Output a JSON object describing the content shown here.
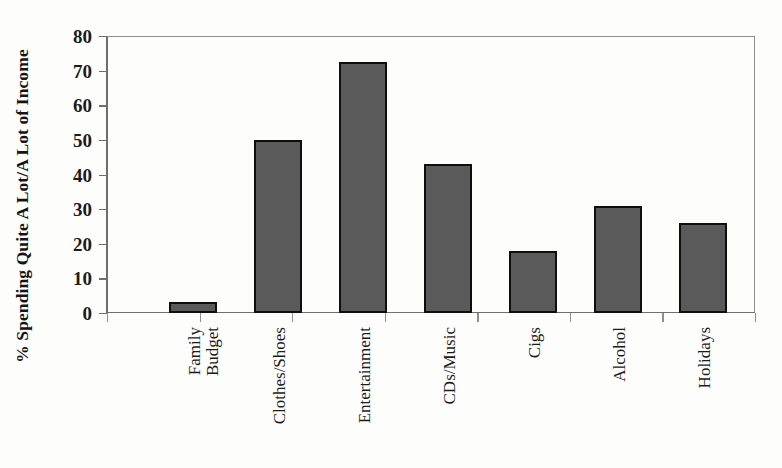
{
  "chart_data": {
    "type": "bar",
    "title": "",
    "subtitle": "",
    "xlabel": "",
    "ylabel": "% Spending Quite A Lot/A Lot of Income",
    "categories": [
      "Family Budget",
      "Clothes/Shoes",
      "Entertainment",
      "CDs/Music",
      "Cigs",
      "Alcohol",
      "Holidays"
    ],
    "category_lines": [
      [
        "Family",
        "Budget"
      ],
      [
        "Clothes/Shoes"
      ],
      [
        "Entertainment"
      ],
      [
        "CDs/Music"
      ],
      [
        "Cigs"
      ],
      [
        "Alcohol"
      ],
      [
        "Holidays"
      ]
    ],
    "values": [
      3.2,
      50,
      72.5,
      43,
      18,
      31,
      26
    ],
    "ylim": [
      0,
      80
    ],
    "ytick_labels": [
      "80",
      "70",
      "60",
      "50",
      "40",
      "30",
      "20",
      "10",
      "0"
    ],
    "ytick_values": [
      80,
      70,
      60,
      50,
      40,
      30,
      20,
      10,
      0
    ],
    "grid": false,
    "legend": "none",
    "bar_fill_color": "#5a5a5a",
    "bar_border_color": "#0e0e0e",
    "axis_color": "#6f6f6f",
    "background_color": "#fdfdfc"
  }
}
